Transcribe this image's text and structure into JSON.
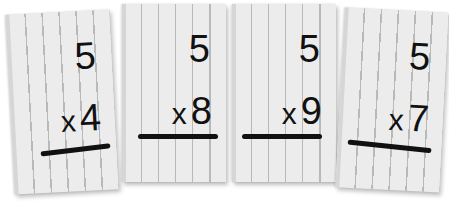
{
  "cards": [
    {
      "top": "5",
      "operator": "x",
      "bottom": "4"
    },
    {
      "top": "5",
      "operator": "x",
      "bottom": "8"
    },
    {
      "top": "5",
      "operator": "x",
      "bottom": "9"
    },
    {
      "top": "5",
      "operator": "x",
      "bottom": "7"
    }
  ],
  "colors": {
    "card": "#ececec",
    "lines": "#b9b9b9",
    "ink": "#111111",
    "background": "#ffffff"
  }
}
